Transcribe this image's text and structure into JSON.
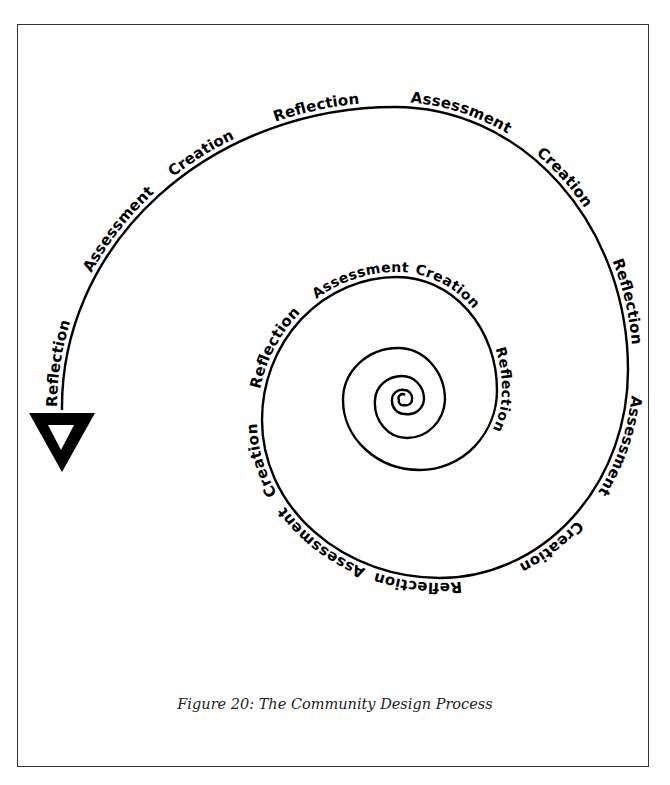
{
  "figure": {
    "caption": "Figure 20: The Community Design Process",
    "stroke_color": "#000000",
    "border_color": "#333333"
  },
  "spiral": {
    "direction": "outward counter-clockwise from center, ending in arrowhead at left",
    "labels": [
      {
        "text": "Reflection",
        "ring": "inner"
      },
      {
        "text": "Creation",
        "ring": "inner"
      },
      {
        "text": "Assessment",
        "ring": "inner"
      },
      {
        "text": "Reflection",
        "ring": "middle"
      },
      {
        "text": "Creation",
        "ring": "middle"
      },
      {
        "text": "Assessment",
        "ring": "middle"
      },
      {
        "text": "Reflection",
        "ring": "middle"
      },
      {
        "text": "Creation",
        "ring": "middle"
      },
      {
        "text": "Assessment",
        "ring": "outer"
      },
      {
        "text": "Reflection",
        "ring": "outer"
      },
      {
        "text": "Creation",
        "ring": "outer"
      },
      {
        "text": "Assessment",
        "ring": "outer"
      },
      {
        "text": "Reflection",
        "ring": "outer"
      },
      {
        "text": "Creation",
        "ring": "outer"
      },
      {
        "text": "Assessment",
        "ring": "outer"
      },
      {
        "text": "Reflection",
        "ring": "outer"
      }
    ]
  }
}
